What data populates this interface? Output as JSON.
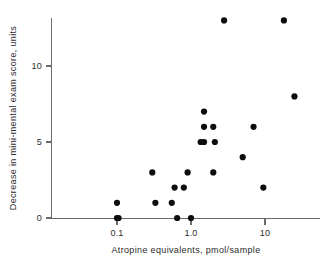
{
  "chart_data": {
    "type": "scatter",
    "title": "",
    "xlabel": "Atropine equivalents, pmol/sample",
    "ylabel": "Decrease in mini-mental exam score, units",
    "xscale": "log",
    "yscale": "linear",
    "xlim": [
      0.045,
      35
    ],
    "ylim": [
      0,
      13.8
    ],
    "grid": false,
    "legend": null,
    "x_ticks": [
      {
        "value": 0.1,
        "label": "0.1"
      },
      {
        "value": 1.0,
        "label": "1.0"
      },
      {
        "value": 10,
        "label": "10"
      }
    ],
    "y_ticks": [
      {
        "value": 0,
        "label": "0"
      },
      {
        "value": 5,
        "label": "5"
      },
      {
        "value": 10,
        "label": "10"
      }
    ],
    "marker": {
      "shape": "circle",
      "color": "#0d0d0d",
      "size": 3.1
    },
    "points": [
      {
        "x": 0.1,
        "y": 0
      },
      {
        "x": 0.105,
        "y": 0
      },
      {
        "x": 0.65,
        "y": 0
      },
      {
        "x": 1.0,
        "y": 0
      },
      {
        "x": 0.1,
        "y": 1
      },
      {
        "x": 0.33,
        "y": 1
      },
      {
        "x": 0.55,
        "y": 1
      },
      {
        "x": 0.6,
        "y": 2
      },
      {
        "x": 0.8,
        "y": 2
      },
      {
        "x": 9.5,
        "y": 2
      },
      {
        "x": 0.3,
        "y": 3
      },
      {
        "x": 0.9,
        "y": 3
      },
      {
        "x": 2.0,
        "y": 3
      },
      {
        "x": 5.0,
        "y": 4
      },
      {
        "x": 1.35,
        "y": 5
      },
      {
        "x": 1.5,
        "y": 5
      },
      {
        "x": 2.1,
        "y": 5
      },
      {
        "x": 1.5,
        "y": 6
      },
      {
        "x": 2.0,
        "y": 6
      },
      {
        "x": 7.0,
        "y": 6
      },
      {
        "x": 1.5,
        "y": 7
      },
      {
        "x": 25.0,
        "y": 8
      },
      {
        "x": 2.8,
        "y": 13
      },
      {
        "x": 18.0,
        "y": 13
      }
    ]
  },
  "axes": {
    "x_axis_label": "Atropine equivalents, pmol/sample",
    "y_axis_label": "Decrease in mini-mental exam score, units"
  }
}
